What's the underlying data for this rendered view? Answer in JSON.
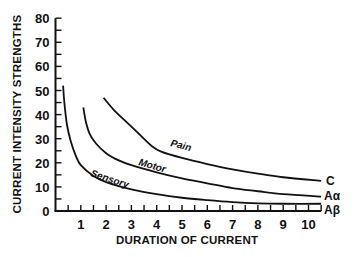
{
  "chart_data": {
    "type": "line",
    "title": "",
    "xlabel": "DURATION OF CURRENT",
    "ylabel": "CURRENT INTENSITY STRENGTHS",
    "xlim": [
      0,
      10.5
    ],
    "ylim": [
      0,
      80
    ],
    "x_ticks": [
      1,
      2,
      3,
      4,
      5,
      6,
      7,
      8,
      9,
      10
    ],
    "y_ticks": [
      0,
      10,
      20,
      30,
      40,
      50,
      60,
      70,
      80
    ],
    "grid": false,
    "legend": "inline labels on curves and at right end",
    "series": [
      {
        "name": "Sensory",
        "end_label": "Aβ",
        "points": [
          [
            0.3,
            52
          ],
          [
            0.35,
            45
          ],
          [
            0.45,
            36
          ],
          [
            0.6,
            29
          ],
          [
            0.8,
            23
          ],
          [
            1,
            19
          ],
          [
            1.5,
            14.5
          ],
          [
            2,
            12
          ],
          [
            3,
            9
          ],
          [
            4,
            7
          ],
          [
            5,
            5.5
          ],
          [
            6,
            4.5
          ],
          [
            7,
            3.7
          ],
          [
            8,
            3.2
          ],
          [
            9,
            3
          ],
          [
            10.5,
            3
          ]
        ]
      },
      {
        "name": "Motor",
        "end_label": "Aα",
        "points": [
          [
            1.1,
            43
          ],
          [
            1.2,
            37
          ],
          [
            1.35,
            32
          ],
          [
            1.6,
            28
          ],
          [
            2,
            24
          ],
          [
            2.5,
            21
          ],
          [
            3,
            19
          ],
          [
            4,
            16
          ],
          [
            5,
            13.5
          ],
          [
            6,
            11.5
          ],
          [
            7,
            9.5
          ],
          [
            8,
            8.2
          ],
          [
            9,
            7
          ],
          [
            10.5,
            6
          ]
        ]
      },
      {
        "name": "Pain",
        "end_label": "C",
        "points": [
          [
            1.9,
            47
          ],
          [
            2.3,
            42
          ],
          [
            2.8,
            37
          ],
          [
            3.3,
            32
          ],
          [
            3.8,
            27
          ],
          [
            4.2,
            24.5
          ],
          [
            5,
            22
          ],
          [
            6,
            19.5
          ],
          [
            7,
            17.3
          ],
          [
            8,
            15.5
          ],
          [
            9,
            14
          ],
          [
            10.5,
            12.5
          ]
        ]
      }
    ]
  },
  "labels": {
    "y_axis_title": "CURRENT INTENSITY STRENGTHS",
    "x_axis_title": "DURATION OF CURRENT",
    "sensory": "Sensory",
    "motor": "Motor",
    "pain": "Pain",
    "c": "C",
    "a_alpha": "Aα",
    "a_beta": "Aβ"
  }
}
